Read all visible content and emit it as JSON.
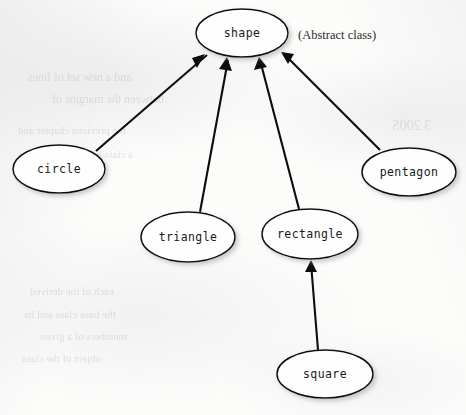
{
  "figure": {
    "kind": "class-inheritance-diagram",
    "notation": "uml-generalization",
    "width": 466,
    "height": 415,
    "background_color": "#fcfcfb",
    "stroke_color": "#0d0d0d",
    "node_fill_color": "#fefefe",
    "label_color": "#1a1a1a"
  },
  "annotations": [
    {
      "id": "abstract-note",
      "text": "(Abstract class)",
      "x": 298,
      "y": 35,
      "refers_to": "shape"
    }
  ],
  "nodes": [
    {
      "id": "shape",
      "label": "shape",
      "cx": 242,
      "cy": 33,
      "rx": 46,
      "ry": 24,
      "level": 0,
      "abstract": true
    },
    {
      "id": "circle",
      "label": "circle",
      "cx": 59,
      "cy": 169,
      "rx": 46,
      "ry": 24,
      "level": 1,
      "abstract": false
    },
    {
      "id": "triangle",
      "label": "triangle",
      "cx": 188,
      "cy": 237,
      "rx": 47,
      "ry": 25,
      "level": 1,
      "abstract": false
    },
    {
      "id": "rectangle",
      "label": "rectangle",
      "cx": 310,
      "cy": 234,
      "rx": 48,
      "ry": 25,
      "level": 1,
      "abstract": false
    },
    {
      "id": "pentagon",
      "label": "pentagon",
      "cx": 409,
      "cy": 172,
      "rx": 47,
      "ry": 24,
      "level": 1,
      "abstract": false
    },
    {
      "id": "square",
      "label": "square",
      "cx": 325,
      "cy": 374,
      "rx": 48,
      "ry": 24,
      "level": 2,
      "abstract": false
    }
  ],
  "edges": [
    {
      "id": "circle-to-shape",
      "from": "circle",
      "to": "shape",
      "relation": "inherits-from",
      "arrow_at": "to",
      "x1": 96,
      "y1": 151,
      "x2": 205,
      "y2": 54
    },
    {
      "id": "triangle-to-shape",
      "from": "triangle",
      "to": "shape",
      "relation": "inherits-from",
      "arrow_at": "to",
      "x1": 200,
      "y1": 212,
      "x2": 227,
      "y2": 57
    },
    {
      "id": "rectangle-to-shape",
      "from": "rectangle",
      "to": "shape",
      "relation": "inherits-from",
      "arrow_at": "to",
      "x1": 299,
      "y1": 209,
      "x2": 259,
      "y2": 57
    },
    {
      "id": "pentagon-to-shape",
      "from": "pentagon",
      "to": "shape",
      "relation": "inherits-from",
      "arrow_at": "to",
      "x1": 380,
      "y1": 150,
      "x2": 281,
      "y2": 52
    },
    {
      "id": "square-to-rectangle",
      "from": "square",
      "to": "rectangle",
      "relation": "inherits-from",
      "arrow_at": "to",
      "x1": 318,
      "y1": 350,
      "x2": 311,
      "y2": 260
    }
  ],
  "bleed_through": [
    {
      "text": "and a new set of lines",
      "x": 28,
      "y": 70,
      "size": 12
    },
    {
      "text": "between the margins of",
      "x": 52,
      "y": 92,
      "size": 12
    },
    {
      "text": "3 200S",
      "x": 392,
      "y": 118,
      "size": 14
    },
    {
      "text": "the previous chapter and",
      "x": 18,
      "y": 124,
      "size": 11
    },
    {
      "text": "a class hierarchy",
      "x": 60,
      "y": 148,
      "size": 11
    },
    {
      "text": "each of the derived",
      "x": 30,
      "y": 285,
      "size": 11
    },
    {
      "text": "the base class and its",
      "x": 24,
      "y": 308,
      "size": 11
    },
    {
      "text": "members of a given",
      "x": 40,
      "y": 330,
      "size": 11
    },
    {
      "text": "object of the class",
      "x": 22,
      "y": 352,
      "size": 11
    }
  ]
}
